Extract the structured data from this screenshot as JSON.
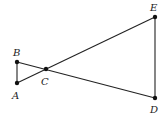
{
  "diagram": {
    "type": "geometry",
    "points": [
      {
        "name": "A",
        "label": "A",
        "x": 17,
        "y": 83,
        "lx": 14,
        "ly": 99
      },
      {
        "name": "B",
        "label": "B",
        "x": 17,
        "y": 62,
        "lx": 16,
        "ly": 55
      },
      {
        "name": "C",
        "label": "C",
        "x": 46,
        "y": 69,
        "lx": 43,
        "ly": 85
      },
      {
        "name": "D",
        "label": "D",
        "x": 155,
        "y": 98,
        "lx": 151,
        "ly": 112
      },
      {
        "name": "E",
        "label": "E",
        "x": 155,
        "y": 17,
        "lx": 151,
        "ly": 11
      }
    ],
    "segments": [
      [
        "A",
        "B"
      ],
      [
        "B",
        "D"
      ],
      [
        "A",
        "E"
      ],
      [
        "E",
        "D"
      ]
    ],
    "colors": {
      "stroke": "#222222",
      "point": "#111111"
    }
  }
}
